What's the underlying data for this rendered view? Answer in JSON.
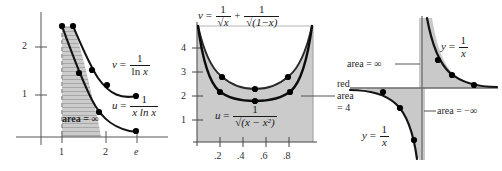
{
  "figure": {
    "panel_count": 3,
    "ink_color": "#1a1a1a",
    "shade_color": "#c9c9c9",
    "curve_color": "#111111",
    "marker_color": "#000000"
  },
  "panel_left": {
    "name": "log-integral-divergence",
    "y_ticks": [
      "2",
      "1"
    ],
    "x_ticks": [
      ".",
      "1",
      "2",
      "e"
    ],
    "x_tick_1": "1",
    "x_tick_2": "2",
    "x_tick_e": "e",
    "area_label": "area = ∞",
    "label_v": {
      "lhs": "v",
      "eq": "=",
      "num": "1",
      "den_fn": "ln",
      "den_var": "x"
    },
    "label_u": {
      "lhs": "u",
      "eq": "=",
      "num": "1",
      "den_var": "x",
      "den_fn": "ln x"
    },
    "dashed_asymptote_x": "1",
    "shading": "hatched-gray"
  },
  "panel_middle": {
    "name": "inverse-sqrt-comparison",
    "title": {
      "lhs": "v",
      "eq": "=",
      "t1_num": "1",
      "t1_den": "√x",
      "plus": "+",
      "t2_num": "1",
      "t2_den": "√(1−x)"
    },
    "y_ticks": [
      "4",
      "3",
      "2",
      "1"
    ],
    "x_ticks": [
      ".2",
      ".4",
      ".6",
      ".8"
    ],
    "label_u": {
      "lhs": "u",
      "eq": "=",
      "num": "1",
      "den": "√(x − x²)"
    },
    "side_note": [
      "red",
      "area",
      "= 4"
    ],
    "side_note_line1": "red",
    "side_note_line2": "area",
    "side_note_line3": "= 4",
    "v_min_value": "2.828",
    "u_min_value": "2",
    "shading": "solid-gray"
  },
  "panel_right": {
    "name": "hyperbola-signed-areas",
    "label_upper_right": {
      "lhs": "y",
      "eq": "=",
      "num": "1",
      "den": "x"
    },
    "label_lower_left": {
      "lhs": "y",
      "eq": "=",
      "num": "1",
      "den": "x"
    },
    "area_positive": "area = ∞",
    "area_negative": "area = −∞",
    "shading": "solid-gray"
  }
}
